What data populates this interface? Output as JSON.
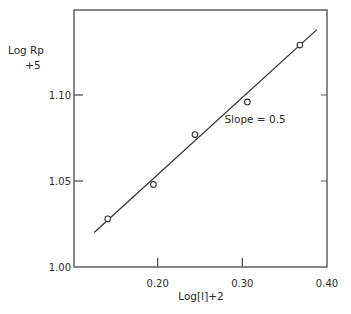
{
  "chart_data": {
    "type": "scatter",
    "title": "",
    "xlabel": "Log[I]+2",
    "ylabel_line1": "Log Rp",
    "ylabel_line2": "+5",
    "xlim": [
      0.1,
      0.4
    ],
    "ylim": [
      1.0,
      1.15
    ],
    "x_ticks": [
      0.2,
      0.3,
      0.4
    ],
    "x_tick_labels": [
      "0.20",
      "0.30",
      "0.40"
    ],
    "y_ticks": [
      1.0,
      1.05,
      1.1
    ],
    "y_tick_labels": [
      "1.00",
      "1.05",
      "1.10"
    ],
    "grid": false,
    "series": [
      {
        "name": "data",
        "marker": "open-circle",
        "x": [
          0.141,
          0.195,
          0.244,
          0.306,
          0.368
        ],
        "y": [
          1.028,
          1.048,
          1.077,
          1.096,
          1.129
        ]
      }
    ],
    "fit_line": {
      "x": [
        0.125,
        0.388
      ],
      "y": [
        1.02,
        1.138
      ]
    },
    "annotations": [
      {
        "text": "Slope = 0.5",
        "x": 0.315,
        "y": 1.084
      }
    ]
  },
  "caption_visible": "Figure (caption cut off)"
}
